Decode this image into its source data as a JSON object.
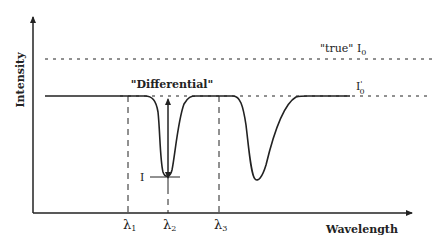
{
  "diagram": {
    "y_axis_label": "Intensity",
    "x_axis_label": "Wavelength",
    "true_i0_label": "\"true\" I",
    "true_i0_sub": "0",
    "i0_prime_label": "I",
    "i0_prime_sup": "'",
    "i0_prime_sub": "0",
    "differential_label": "\"Differential\"",
    "i_label": "I",
    "lambda_labels": [
      {
        "symbol": "λ",
        "sub": "1"
      },
      {
        "symbol": "λ",
        "sub": "2"
      },
      {
        "symbol": "λ",
        "sub": "3"
      }
    ],
    "line_color": "#222222"
  }
}
